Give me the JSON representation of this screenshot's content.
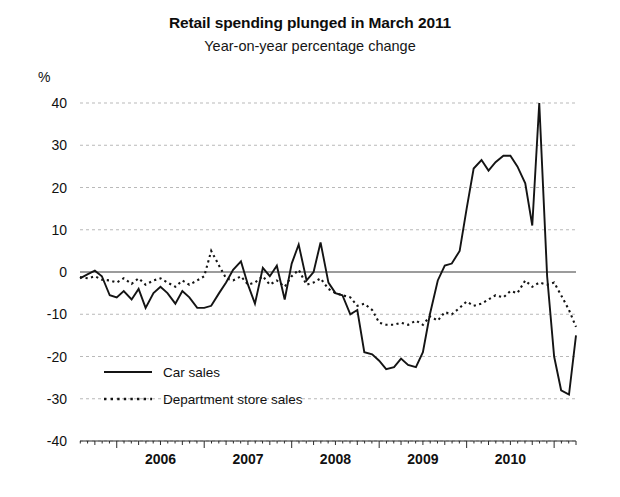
{
  "chart_data": {
    "type": "line",
    "title": "Retail spending plunged in March 2011",
    "subtitle": "Year-on-year percentage change",
    "unit_label": "%",
    "xlabel": "",
    "ylabel": "",
    "ylim": [
      -40,
      40
    ],
    "ytick_labels": [
      "40",
      "30",
      "20",
      "10",
      "0",
      "-10",
      "-20",
      "-30",
      "-40"
    ],
    "ytick_values": [
      40,
      30,
      20,
      10,
      0,
      -10,
      -20,
      -30,
      -40
    ],
    "xtick_labels": [
      "2006",
      "2007",
      "2008",
      "2009",
      "2010"
    ],
    "xtick_values": [
      2006,
      2007,
      2008,
      2009,
      2010
    ],
    "x_start": 2005.58,
    "x_end": 2011.25,
    "grid": "horizontal-dotted",
    "legend_position": "inside-lower-left",
    "series": [
      {
        "name": "Car sales",
        "style": "solid",
        "x": [
          2005.58,
          2005.67,
          2005.75,
          2005.83,
          2005.92,
          2006.0,
          2006.08,
          2006.17,
          2006.25,
          2006.33,
          2006.42,
          2006.5,
          2006.58,
          2006.67,
          2006.75,
          2006.83,
          2006.92,
          2007.0,
          2007.08,
          2007.17,
          2007.25,
          2007.33,
          2007.42,
          2007.5,
          2007.58,
          2007.67,
          2007.75,
          2007.83,
          2007.92,
          2008.0,
          2008.08,
          2008.17,
          2008.25,
          2008.33,
          2008.42,
          2008.5,
          2008.58,
          2008.67,
          2008.75,
          2008.83,
          2008.92,
          2009.0,
          2009.08,
          2009.17,
          2009.25,
          2009.33,
          2009.42,
          2009.5,
          2009.58,
          2009.67,
          2009.75,
          2009.83,
          2009.92,
          2010.0,
          2010.08,
          2010.17,
          2010.25,
          2010.33,
          2010.42,
          2010.5,
          2010.58,
          2010.67,
          2010.75,
          2010.83,
          2010.92,
          2011.0,
          2011.08,
          2011.17,
          2011.25
        ],
        "values": [
          -1.5,
          -0.5,
          0.3,
          -1.0,
          -5.5,
          -6.0,
          -4.5,
          -6.5,
          -4.0,
          -8.5,
          -5.0,
          -3.5,
          -5.0,
          -7.5,
          -4.5,
          -6.0,
          -8.5,
          -8.5,
          -8.0,
          -5.0,
          -2.5,
          0.5,
          2.5,
          -3.0,
          -7.5,
          1.0,
          -1.0,
          1.5,
          -6.5,
          2.0,
          6.5,
          -2.0,
          0.0,
          7.0,
          -2.5,
          -5.0,
          -5.5,
          -10.0,
          -9.0,
          -19.0,
          -19.5,
          -21.0,
          -23.0,
          -22.5,
          -20.5,
          -22.0,
          -22.5,
          -19.0,
          -10.0,
          -2.0,
          1.5,
          2.0,
          5.0,
          15.0,
          24.5,
          26.5,
          24.0,
          26.0,
          27.5,
          27.5,
          25.0,
          21.0,
          11.0,
          40.0,
          -1.0,
          -20.0,
          -28.0,
          -29.0,
          -15.0
        ]
      },
      {
        "name": "Department store sales",
        "style": "dotted",
        "x": [
          2005.58,
          2005.67,
          2005.75,
          2005.83,
          2005.92,
          2006.0,
          2006.08,
          2006.17,
          2006.25,
          2006.33,
          2006.42,
          2006.5,
          2006.58,
          2006.67,
          2006.75,
          2006.83,
          2006.92,
          2007.0,
          2007.08,
          2007.17,
          2007.25,
          2007.33,
          2007.42,
          2007.5,
          2007.58,
          2007.67,
          2007.75,
          2007.83,
          2007.92,
          2008.0,
          2008.08,
          2008.17,
          2008.25,
          2008.33,
          2008.42,
          2008.5,
          2008.58,
          2008.67,
          2008.75,
          2008.83,
          2008.92,
          2009.0,
          2009.08,
          2009.17,
          2009.25,
          2009.33,
          2009.42,
          2009.5,
          2009.58,
          2009.67,
          2009.75,
          2009.83,
          2009.92,
          2010.0,
          2010.08,
          2010.17,
          2010.25,
          2010.33,
          2010.42,
          2010.5,
          2010.58,
          2010.67,
          2010.75,
          2010.83,
          2010.92,
          2011.0,
          2011.08,
          2011.17,
          2011.25
        ],
        "values": [
          -1.2,
          -1.5,
          -1.0,
          -1.8,
          -2.0,
          -2.5,
          -1.5,
          -2.8,
          -1.5,
          -3.0,
          -2.0,
          -1.5,
          -2.5,
          -3.5,
          -2.0,
          -3.0,
          -2.0,
          -1.0,
          5.0,
          1.5,
          -1.5,
          -2.0,
          -1.0,
          -3.0,
          -2.5,
          -1.0,
          -3.0,
          -2.0,
          -3.5,
          -1.0,
          0.5,
          -3.0,
          -2.5,
          -1.5,
          -4.0,
          -5.0,
          -5.5,
          -6.0,
          -8.0,
          -7.5,
          -9.0,
          -12.0,
          -12.5,
          -12.5,
          -12.0,
          -12.5,
          -11.5,
          -12.5,
          -10.5,
          -11.5,
          -9.5,
          -10.0,
          -8.5,
          -7.0,
          -8.0,
          -7.5,
          -6.5,
          -5.5,
          -6.0,
          -4.5,
          -5.0,
          -2.0,
          -3.5,
          -2.5,
          -3.0,
          -2.5,
          -5.5,
          -9.0,
          -13.0
        ]
      }
    ]
  },
  "legend": {
    "items": [
      {
        "label": "Car sales",
        "style": "solid"
      },
      {
        "label": "Department store sales",
        "style": "dotted"
      }
    ]
  }
}
